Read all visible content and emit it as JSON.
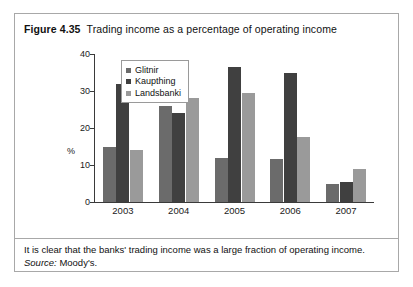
{
  "figure": {
    "number_label": "Figure 4.35",
    "title": "Trading income as a percentage of operating income",
    "caption": "It is clear that the banks' trading income was a large fraction of operating income.",
    "source_label": "Source:",
    "source_value": "Moody's."
  },
  "colors": {
    "glitnir": "#6b6b6b",
    "kaupthing": "#404040",
    "landsbanki": "#9a9a9a",
    "axis": "#3a3a3a",
    "frame": "#a8a8a8",
    "text": "#111111"
  },
  "chart_data": {
    "type": "bar",
    "title": "Trading income as a percentage of operating income",
    "xlabel": "",
    "ylabel": "%",
    "categories": [
      "2003",
      "2004",
      "2005",
      "2006",
      "2007"
    ],
    "series": [
      {
        "name": "Glitnir",
        "values": [
          15,
          26,
          12,
          11.5,
          5
        ]
      },
      {
        "name": "Kaupthing",
        "values": [
          32,
          24,
          36.5,
          35,
          5.5
        ]
      },
      {
        "name": "Landsbanki",
        "values": [
          14,
          28,
          29.5,
          17.5,
          9
        ]
      }
    ],
    "ylim": [
      0,
      40
    ],
    "yticks": [
      0,
      10,
      20,
      30,
      40
    ],
    "ytick_labels": [
      "0",
      "10",
      "20",
      "30",
      "40"
    ],
    "grid": false,
    "legend_position": "top-left-inside"
  }
}
